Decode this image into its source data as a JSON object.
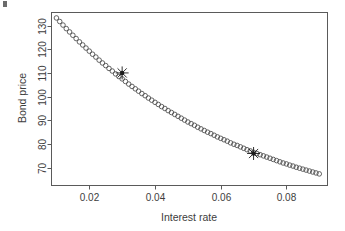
{
  "chart_data": {
    "type": "scatter",
    "title": "",
    "xlabel": "Interest rate",
    "ylabel": "Bond price",
    "xlim": [
      0.0085,
      0.0925
    ],
    "ylim": [
      62.5,
      135.5
    ],
    "xticks": [
      "0.02",
      "0.04",
      "0.06",
      "0.08"
    ],
    "xtick_values": [
      0.02,
      0.04,
      0.06,
      0.08
    ],
    "yticks": [
      "70",
      "80",
      "90",
      "100",
      "110",
      "120",
      "130"
    ],
    "ytick_values": [
      70,
      80,
      90,
      100,
      110,
      120,
      130
    ],
    "grid": false,
    "legend": "none",
    "marker": "open-circle",
    "series": [
      {
        "name": "Bond price vs interest rate",
        "x": [
          0.01,
          0.011,
          0.012,
          0.013,
          0.014,
          0.015,
          0.016,
          0.017,
          0.018,
          0.019,
          0.02,
          0.021,
          0.022,
          0.023,
          0.024,
          0.025,
          0.026,
          0.027,
          0.028,
          0.029,
          0.03,
          0.031,
          0.032,
          0.033,
          0.034,
          0.035,
          0.036,
          0.037,
          0.038,
          0.039,
          0.04,
          0.041,
          0.042,
          0.043,
          0.044,
          0.045,
          0.046,
          0.047,
          0.048,
          0.049,
          0.05,
          0.051,
          0.052,
          0.053,
          0.054,
          0.055,
          0.056,
          0.057,
          0.058,
          0.059,
          0.06,
          0.061,
          0.062,
          0.063,
          0.064,
          0.065,
          0.066,
          0.067,
          0.068,
          0.069,
          0.07,
          0.071,
          0.072,
          0.073,
          0.074,
          0.075,
          0.076,
          0.077,
          0.078,
          0.079,
          0.08,
          0.081,
          0.082,
          0.083,
          0.084,
          0.085,
          0.086,
          0.087,
          0.088,
          0.089,
          0.09
        ],
        "y": [
          133.2,
          131.7,
          130.2,
          128.7,
          127.3,
          125.9,
          124.5,
          123.1,
          121.8,
          120.5,
          119.2,
          117.9,
          116.7,
          115.4,
          114.2,
          113.1,
          111.9,
          110.8,
          109.6,
          108.5,
          107.5,
          106.4,
          105.3,
          104.3,
          103.3,
          102.3,
          101.3,
          100.4,
          99.4,
          98.5,
          97.6,
          96.7,
          95.8,
          95.0,
          94.1,
          93.3,
          92.5,
          91.7,
          90.9,
          90.1,
          89.3,
          88.6,
          87.9,
          87.1,
          86.4,
          85.7,
          85.0,
          84.4,
          83.7,
          83.0,
          82.4,
          81.8,
          81.2,
          80.5,
          79.9,
          79.4,
          78.8,
          78.2,
          77.6,
          77.1,
          76.5,
          76.0,
          75.5,
          75.0,
          74.5,
          74.0,
          73.5,
          73.0,
          72.5,
          72.0,
          71.6,
          71.1,
          70.7,
          70.2,
          69.8,
          69.4,
          69.0,
          68.6,
          68.2,
          67.8,
          67.4
        ]
      }
    ],
    "annotations": [
      {
        "label": "",
        "marker": "asterisk",
        "x": 0.03,
        "y": 110.0
      },
      {
        "label": "",
        "marker": "asterisk",
        "x": 0.07,
        "y": 76.0
      }
    ]
  }
}
